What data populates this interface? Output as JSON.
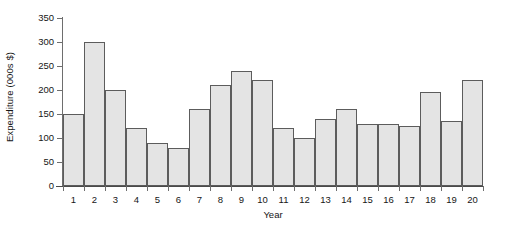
{
  "chart_data": {
    "type": "bar",
    "title": "",
    "xlabel": "Year",
    "ylabel": "Expenditure (000s $)",
    "categories": [
      "1",
      "2",
      "3",
      "4",
      "5",
      "6",
      "7",
      "8",
      "9",
      "10",
      "11",
      "12",
      "13",
      "14",
      "15",
      "16",
      "17",
      "18",
      "19",
      "20"
    ],
    "values": [
      150,
      300,
      200,
      120,
      90,
      80,
      160,
      210,
      240,
      220,
      120,
      100,
      140,
      160,
      130,
      130,
      125,
      195,
      135,
      220
    ],
    "ylim": [
      0,
      350
    ],
    "yticks": [
      "0",
      "50",
      "100",
      "150",
      "200",
      "250",
      "300",
      "350"
    ],
    "ytick_values": [
      0,
      50,
      100,
      150,
      200,
      250,
      300,
      350
    ],
    "grid": false,
    "legend": false,
    "bar_fill_color": "#e4e4e4",
    "bar_edge_color": "#5c5c5c",
    "axis_color": "#6e6e6e",
    "background_color": "#ffffff"
  }
}
